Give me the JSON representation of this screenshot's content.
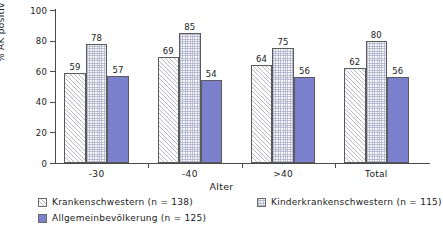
{
  "chart_data": {
    "type": "bar",
    "title": "",
    "subtitle": "",
    "xlabel": "Alter",
    "ylabel": "% AK positiv",
    "categories": [
      "-30",
      "-40",
      ">40",
      "Total"
    ],
    "series": [
      {
        "name": "Krankenschwestern (n = 138)",
        "pattern": "diagonal-hatch",
        "color": "#fdfdfd",
        "values": [
          59,
          69,
          64,
          62
        ]
      },
      {
        "name": "Kinderkrankenschwestern (n = 115)",
        "pattern": "stipple-dots",
        "color": "#fcfcfe",
        "values": [
          78,
          85,
          75,
          80
        ]
      },
      {
        "name": "Allgemeinbevölkerung (n = 125)",
        "pattern": "solid",
        "color": "#7b80cc",
        "values": [
          57,
          54,
          56,
          56
        ]
      }
    ],
    "ylim": [
      0,
      100
    ],
    "yticks": [
      0,
      20,
      40,
      60,
      80,
      100
    ],
    "ytick_labels": [
      "0",
      "20",
      "40",
      "60",
      "80",
      "100"
    ],
    "grid": false,
    "legend_position": "bottom-left",
    "bar_value_labels": true
  },
  "axes": {
    "y_label": "% AK positiv",
    "x_label": "Alter"
  },
  "legend": {
    "items": [
      {
        "label": "Krankenschwestern (n = 138)",
        "swatch": "diagonal-hatch"
      },
      {
        "label": "Kinderkrankenschwestern (n = 115)",
        "swatch": "stipple-dots"
      },
      {
        "label": "Allgemeinbevölkerung (n = 125)",
        "swatch": "solid-blue"
      }
    ]
  }
}
